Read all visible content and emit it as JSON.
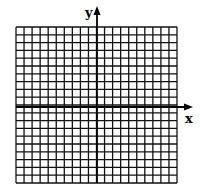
{
  "diagram": {
    "type": "coordinate-grid",
    "x_axis_label": "x",
    "y_axis_label": "y",
    "columns": 20,
    "rows": 20,
    "origin_column": 10,
    "origin_row": 10,
    "line_color": "#000000",
    "background_color": "#ffffff"
  }
}
